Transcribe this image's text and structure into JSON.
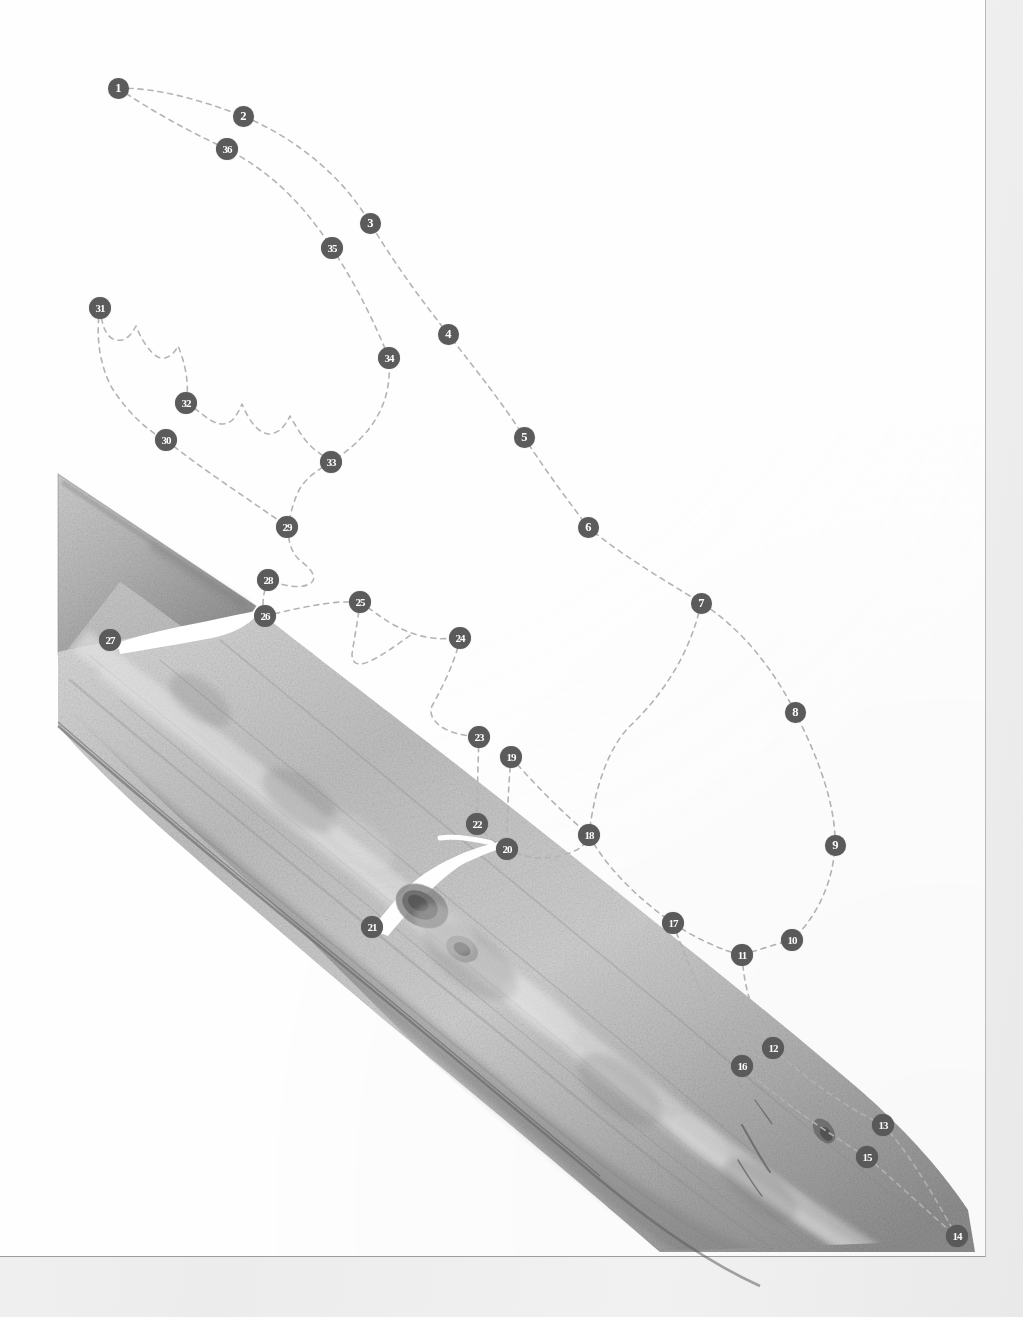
{
  "figure": {
    "kind": "scanned-plate",
    "marker_count": 36,
    "marker_fill": "#5b5b5b",
    "marker_text_color": "#ffffff",
    "outline_color": "#b4b4b4",
    "page_background": "#ffffff",
    "sheet_background": "#fefefe",
    "specimen_tone_light": "#d9d9d9",
    "specimen_tone_mid": "#a9a9a9",
    "specimen_tone_dark": "#6f6f6f",
    "highlight_color": "#ffffff"
  },
  "markers": [
    {
      "label": "1",
      "x": 118,
      "y": 88
    },
    {
      "label": "2",
      "x": 243,
      "y": 116
    },
    {
      "label": "3",
      "x": 370,
      "y": 223
    },
    {
      "label": "4",
      "x": 448,
      "y": 334
    },
    {
      "label": "5",
      "x": 524,
      "y": 437
    },
    {
      "label": "6",
      "x": 588,
      "y": 527
    },
    {
      "label": "7",
      "x": 701,
      "y": 603
    },
    {
      "label": "8",
      "x": 795,
      "y": 712
    },
    {
      "label": "9",
      "x": 835,
      "y": 845
    },
    {
      "label": "10",
      "x": 792,
      "y": 940
    },
    {
      "label": "11",
      "x": 742,
      "y": 955
    },
    {
      "label": "12",
      "x": 773,
      "y": 1048
    },
    {
      "label": "13",
      "x": 883,
      "y": 1125
    },
    {
      "label": "14",
      "x": 957,
      "y": 1236
    },
    {
      "label": "15",
      "x": 867,
      "y": 1157
    },
    {
      "label": "16",
      "x": 742,
      "y": 1066
    },
    {
      "label": "17",
      "x": 673,
      "y": 923
    },
    {
      "label": "18",
      "x": 589,
      "y": 835
    },
    {
      "label": "19",
      "x": 511,
      "y": 757
    },
    {
      "label": "20",
      "x": 507,
      "y": 849
    },
    {
      "label": "21",
      "x": 372,
      "y": 927
    },
    {
      "label": "22",
      "x": 477,
      "y": 824
    },
    {
      "label": "23",
      "x": 479,
      "y": 737
    },
    {
      "label": "24",
      "x": 460,
      "y": 638
    },
    {
      "label": "25",
      "x": 360,
      "y": 602
    },
    {
      "label": "26",
      "x": 265,
      "y": 616
    },
    {
      "label": "27",
      "x": 110,
      "y": 640
    },
    {
      "label": "28",
      "x": 268,
      "y": 580
    },
    {
      "label": "29",
      "x": 287,
      "y": 527
    },
    {
      "label": "30",
      "x": 166,
      "y": 440
    },
    {
      "label": "31",
      "x": 100,
      "y": 308
    },
    {
      "label": "32",
      "x": 186,
      "y": 403
    },
    {
      "label": "33",
      "x": 331,
      "y": 462
    },
    {
      "label": "34",
      "x": 389,
      "y": 358
    },
    {
      "label": "35",
      "x": 332,
      "y": 248
    },
    {
      "label": "36",
      "x": 227,
      "y": 149
    }
  ],
  "outlines": {
    "blade_upper_path": "M118,88 C160,88 200,100 243,116 C300,140 345,180 370,223 C400,272 424,303 448,334 C476,370 504,405 524,437 C549,476 570,503 588,527 C622,556 668,582 701,603 C742,628 775,672 795,712 C818,757 836,805 835,845 C833,886 814,920 792,940",
    "blade_lower_path": "M118,88 C150,110 186,130 227,149 C270,172 300,200 332,248 C358,288 374,322 389,358 C392,398 378,432 331,462 C300,478 290,500 287,527 C287,550 292,562 300,570 C308,578 296,590 268,580 C262,600 263,610 265,616 C300,610 330,604 360,602 C378,608 400,620 430,632 C442,636 452,638 460,638 C452,660 430,690 420,712 C430,724 452,730 479,737 C478,760 477,800 477,824 C490,836 500,844 507,849",
    "lower_branch_path": "M792,940 C770,952 752,955 742,955 C744,990 752,1020 773,1048 C800,1082 840,1108 883,1125 C910,1145 935,1200 957,1236",
    "lower_branch_path2": "M742,955 C735,985 735,1020 742,1066 C770,1095 810,1120 867,1157 C900,1180 935,1215 957,1236",
    "right_inner_path": "M701,603 C690,650 660,700 620,740 C596,765 590,805 589,835 C600,870 640,900 673,923 C700,935 730,948 742,955",
    "node_tail_path": "M511,757 C530,790 560,815 589,835",
    "node_tail_path2": "M507,849 C540,880 570,910 589,835",
    "tip_hook_path": "M265,616 C240,622 200,628 160,632 C140,636 120,638 110,640",
    "serrate_left_path": "M100,308 C104,330 118,342 126,338 C136,330 142,344 152,352 C164,360 174,348 180,356 C190,372 196,390 186,403 C178,418 170,432 166,440 C200,470 250,500 287,527",
    "serrate_inner_path": "M186,403 C200,414 212,426 222,420 C234,412 240,426 250,434 C262,442 272,430 280,438 C292,450 306,460 331,462"
  }
}
